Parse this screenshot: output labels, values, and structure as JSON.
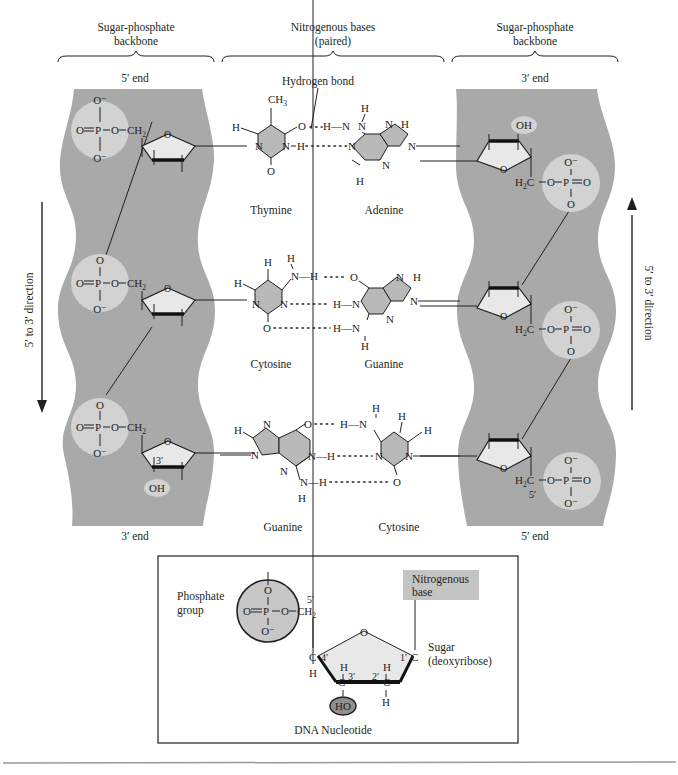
{
  "header": {
    "left_label": [
      "Sugar-phosphate",
      "backbone"
    ],
    "center_label": [
      "Nitrogenous bases",
      "(paired)"
    ],
    "right_label": [
      "Sugar-phosphate",
      "backbone"
    ]
  },
  "strands": {
    "left": {
      "top_end": "5′ end",
      "bottom_end": "3′ end",
      "direction": "5′ to 3′ direction",
      "arrow": "down"
    },
    "right": {
      "top_end": "3′ end",
      "bottom_end": "5′ end",
      "direction": "5′ to 3′ direction",
      "arrow": "up"
    }
  },
  "annotations": {
    "hydrogen_bond": "Hydrogen bond",
    "left_three_prime": "3′",
    "left_oh": "OH",
    "right_oh": "OH",
    "right_five_prime": "5′"
  },
  "base_pairs": [
    {
      "left": "Thymine",
      "right": "Adenine",
      "h_bonds": 2
    },
    {
      "left": "Cytosine",
      "right": "Guanine",
      "h_bonds": 3
    },
    {
      "left": "Guanine",
      "right": "Cytosine",
      "h_bonds": 3
    }
  ],
  "chem": {
    "O": "O",
    "Ominus": "O⁻",
    "P": "P",
    "CH": "CH",
    "two": "2",
    "three": "3",
    "H": "H",
    "N": "N",
    "C": "C",
    "HC": "H",
    "OH": "OH",
    "HO": "HO",
    "O_eq_P_O": "O═P—O—CH",
    "H2C_O_P_O": "—O—P═O",
    "NH": "N—H",
    "HN": "H—N"
  },
  "inset": {
    "title": "DNA Nucleotide",
    "phosphate_label": [
      "Phosphate",
      "group"
    ],
    "base_label": [
      "Nitrogenous",
      "base"
    ],
    "sugar_label": [
      "Sugar",
      "(deoxyribose)"
    ],
    "carbons": [
      "5′",
      "4′",
      "3′",
      "2′",
      "1′"
    ]
  },
  "colors": {
    "backbone": "#a9a9a9",
    "phosphate_circle": "#d2d2d2",
    "base_fill": "#b9b9b9",
    "sugar_fill": "#e8e8e8",
    "inset_base_box": "#c4c4c4",
    "ink": "#231f20"
  }
}
